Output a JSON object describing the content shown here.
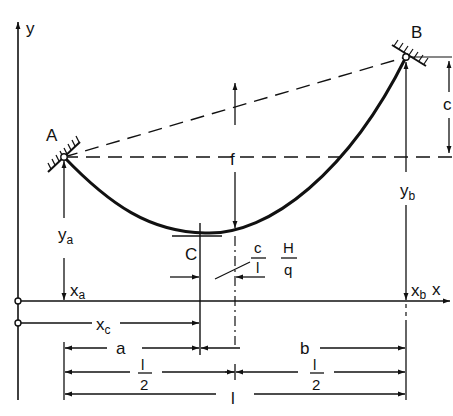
{
  "figure": {
    "type": "catenary-cable-diagram",
    "points": {
      "A": {
        "label": "A",
        "x": 64,
        "y": 157
      },
      "B": {
        "label": "B",
        "x": 406,
        "y": 57
      },
      "C": {
        "label": "C",
        "x": 200,
        "y": 233
      }
    },
    "axes": {
      "x_label": "x",
      "y_label": "y"
    },
    "labels": {
      "ya_main": "y",
      "ya_sub": "a",
      "yb_main": "y",
      "yb_sub": "b",
      "xa_main": "x",
      "xa_sub": "a",
      "xb_main": "x",
      "xb_sub": "b",
      "xc_main": "x",
      "xc_sub": "c",
      "f": "f",
      "c": "c",
      "frac_c_num": "c",
      "frac_c_den": "l",
      "frac_H_num": "H",
      "frac_H_den": "q"
    },
    "dimensions": {
      "row1": {
        "left": "a",
        "right": "b"
      },
      "row2": {
        "left_num": "l",
        "left_den": "2",
        "right_num": "l",
        "right_den": "2"
      },
      "row3": {
        "total": "l"
      }
    },
    "colors": {
      "ink": "#111111",
      "background": "#ffffff"
    }
  }
}
